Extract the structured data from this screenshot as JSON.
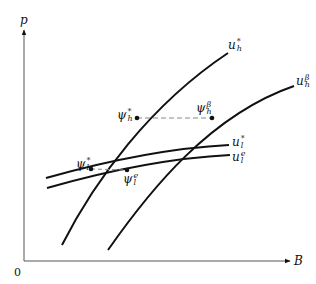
{
  "diagram": {
    "axes": {
      "y_label": "p",
      "x_label": "B",
      "origin_label": "0"
    },
    "curves": [
      {
        "id": "u_h_star",
        "base": "u",
        "sub": "h",
        "sup": "*",
        "style": "solid"
      },
      {
        "id": "u_h_beta",
        "base": "u",
        "sub": "h",
        "sup": "β",
        "style": "solid"
      },
      {
        "id": "u_l_star",
        "base": "u",
        "sub": "l",
        "sup": "*",
        "style": "solid"
      },
      {
        "id": "u_l_e",
        "base": "u",
        "sub": "l",
        "sup": "e",
        "style": "solid"
      }
    ],
    "points": [
      {
        "id": "psi_h_star",
        "base": "ψ",
        "sub": "h",
        "sup": "*"
      },
      {
        "id": "psi_h_beta",
        "base": "ψ",
        "sub": "h",
        "sup": "β"
      },
      {
        "id": "psi_l_star",
        "base": "ψ",
        "sub": "l",
        "sup": "*"
      },
      {
        "id": "psi_l_e",
        "base": "ψ",
        "sub": "l",
        "sup": "e"
      }
    ],
    "dashed_connectors": [
      {
        "from": "psi_h_star",
        "to": "psi_h_beta"
      },
      {
        "from": "psi_l_star",
        "to": "psi_l_e"
      }
    ],
    "colors": {
      "line": "#111111",
      "dashed": "#888888",
      "background": "#ffffff"
    }
  }
}
